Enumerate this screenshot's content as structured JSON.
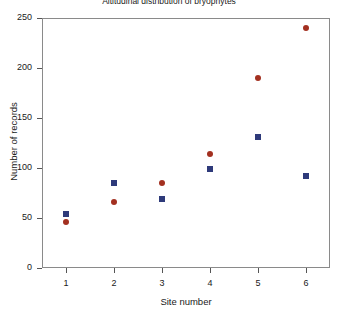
{
  "chart_data": {
    "type": "scatter",
    "title": "Altitudinal distribution of bryophytes",
    "xlabel": "Site number",
    "ylabel": "Number of records",
    "categories": [
      "1",
      "2",
      "3",
      "4",
      "5",
      "6"
    ],
    "x": [
      1,
      2,
      3,
      4,
      5,
      6
    ],
    "xlim": [
      0.5,
      6.5
    ],
    "ylim": [
      0,
      250
    ],
    "xticks": [
      "1",
      "2",
      "3",
      "4",
      "5",
      "6"
    ],
    "yticks": [
      "0",
      "50",
      "100",
      "150",
      "200",
      "250"
    ],
    "grid": false,
    "legend": "none",
    "series": [
      {
        "name": "series-blue-square",
        "marker": "square",
        "color": "#2e3a7a",
        "values": [
          54,
          85,
          69,
          99,
          131,
          92
        ]
      },
      {
        "name": "series-red-circle",
        "marker": "circle",
        "color": "#a33020",
        "values": [
          46,
          66,
          85,
          114,
          190,
          240
        ]
      }
    ]
  }
}
